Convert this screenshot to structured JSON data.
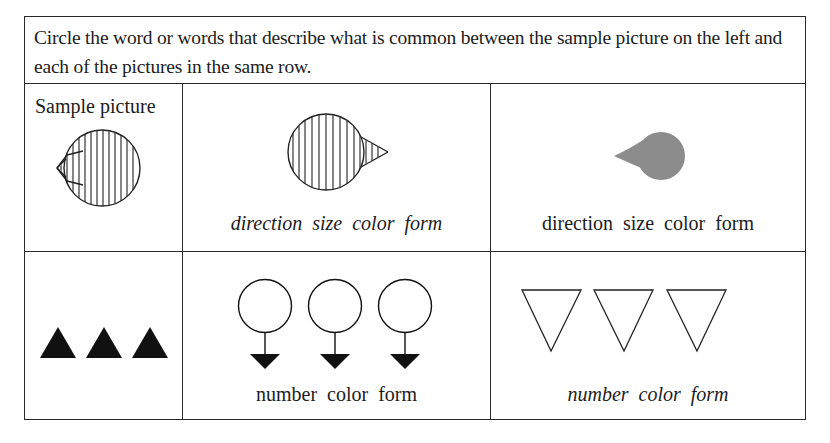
{
  "instructions": "Circle the word or words that describe what is common between the sample picture on the left and each of the pictures in the same row.",
  "header": {
    "sample_label": "Sample picture"
  },
  "rows": [
    {
      "sample": {
        "figure": "striped-circle-with-left-pointing-triangle",
        "icon": "striped-droplet-left-icon"
      },
      "items": [
        {
          "figure": "striped-circle-with-right-pointing-triangle",
          "icon": "striped-droplet-right-icon",
          "caption": "direction size color form",
          "caption_style": "italic"
        },
        {
          "figure": "small-gray-filled-droplet-pointing-left",
          "icon": "gray-droplet-left-icon",
          "caption": "direction size color form",
          "caption_style": "regular",
          "fill_color": "#8c8c8c"
        }
      ]
    },
    {
      "sample": {
        "figure": "three-black-filled-upward-triangles",
        "icon": "filled-triangle-up-icon",
        "count": 3,
        "fill_color": "#111111"
      },
      "items": [
        {
          "figure": "three-circles-with-downward-arrows",
          "icon": "circle-arrow-down-icon",
          "count": 3,
          "caption": "number color form",
          "caption_style": "regular"
        },
        {
          "figure": "three-outlined-downward-triangles",
          "icon": "outline-triangle-down-icon",
          "count": 3,
          "caption": "number color form",
          "caption_style": "italic"
        }
      ]
    }
  ]
}
